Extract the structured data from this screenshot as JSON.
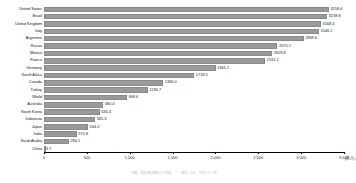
{
  "chart_data": {
    "type": "bar",
    "orientation": "horizontal",
    "title": "",
    "xlabel": "",
    "ylabel": "",
    "unit": "(万人)",
    "xlim": [
      0,
      3500
    ],
    "grid": false,
    "legend": null,
    "tick_labels": [
      "0",
      "500",
      "1,000",
      "1,500",
      "2,000",
      "2,500",
      "3,000",
      "3,500"
    ],
    "ticks": [
      0,
      500,
      1000,
      1500,
      2000,
      2500,
      3000,
      3500
    ],
    "categories": [
      "United States",
      "Brazil",
      "United Kingdom",
      "Italy",
      "Argentina",
      "Russia",
      "Mexico",
      "France",
      "Germany",
      "South Africa",
      "Canada",
      "Turkey",
      "World",
      "Australia",
      "South Korea",
      "Indonesia",
      "Japan",
      "India",
      "Saudi Arabia",
      "China"
    ],
    "values": [
      3258.6,
      3238.8,
      3168.4,
      3146.1,
      2969.6,
      2670.2,
      2609.8,
      2531.2,
      1965.1,
      1719.5,
      1365.0,
      1190.7,
      948.6,
      680.0,
      636.4,
      585.3,
      504.4,
      375.8,
      284.1,
      3.7
    ],
    "value_labels": [
      "3258.6",
      "3238.8",
      "3168.4",
      "3146.1",
      "2969.6",
      "2670.2",
      "2609.8",
      "2531.2",
      "1965.1",
      "1719.5",
      "1365.0",
      "1190.7",
      "948.6",
      "680.0",
      "636.4",
      "585.3",
      "504.4",
      "375.8",
      "284.1",
      "3.7"
    ],
    "bar_color": "#9a9a9a"
  },
  "footer": {
    "note": "出典：各国統計資料より作成　／　単位：万人　（年次データ）"
  }
}
